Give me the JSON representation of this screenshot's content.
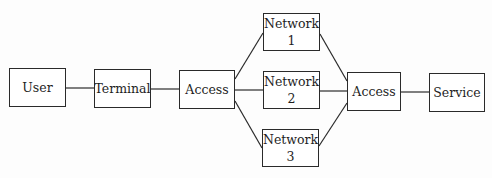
{
  "diagram": {
    "nodes": [
      {
        "id": "user",
        "label": "User",
        "x": 9,
        "y": 68,
        "w": 57,
        "h": 39
      },
      {
        "id": "terminal",
        "label": "Terminal",
        "x": 94,
        "y": 69,
        "w": 57,
        "h": 39
      },
      {
        "id": "access-left",
        "label": "Access",
        "x": 179,
        "y": 70,
        "w": 56,
        "h": 39
      },
      {
        "id": "network-1",
        "label": "Network\n1",
        "x": 263,
        "y": 13,
        "w": 57,
        "h": 38
      },
      {
        "id": "network-2",
        "label": "Network\n2",
        "x": 263,
        "y": 71,
        "w": 57,
        "h": 38
      },
      {
        "id": "network-3",
        "label": "Network\n3",
        "x": 262,
        "y": 129,
        "w": 57,
        "h": 38
      },
      {
        "id": "access-right",
        "label": "Access",
        "x": 347,
        "y": 72,
        "w": 54,
        "h": 39
      },
      {
        "id": "service",
        "label": "Service",
        "x": 429,
        "y": 73,
        "w": 56,
        "h": 39
      }
    ],
    "edges": [
      {
        "from": "user",
        "to": "terminal",
        "x1": 66,
        "y1": 88,
        "x2": 94,
        "y2": 88
      },
      {
        "from": "terminal",
        "to": "access-left",
        "x1": 151,
        "y1": 89,
        "x2": 179,
        "y2": 89
      },
      {
        "from": "access-left",
        "to": "network-1",
        "x1": 235,
        "y1": 79,
        "x2": 263,
        "y2": 33
      },
      {
        "from": "access-left",
        "to": "network-2",
        "x1": 235,
        "y1": 90,
        "x2": 263,
        "y2": 90
      },
      {
        "from": "access-left",
        "to": "network-3",
        "x1": 235,
        "y1": 101,
        "x2": 262,
        "y2": 148
      },
      {
        "from": "network-1",
        "to": "access-right",
        "x1": 320,
        "y1": 34,
        "x2": 347,
        "y2": 81
      },
      {
        "from": "network-2",
        "to": "access-right",
        "x1": 320,
        "y1": 91,
        "x2": 347,
        "y2": 91
      },
      {
        "from": "network-3",
        "to": "access-right",
        "x1": 319,
        "y1": 146,
        "x2": 347,
        "y2": 103
      },
      {
        "from": "access-right",
        "to": "service",
        "x1": 401,
        "y1": 92,
        "x2": 429,
        "y2": 92
      }
    ],
    "colors": {
      "stroke": "#2a2a2a",
      "background": "#ffffff",
      "text": "#1e1e1e"
    }
  }
}
